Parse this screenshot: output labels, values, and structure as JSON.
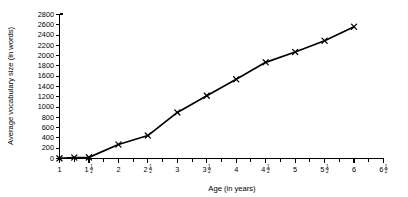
{
  "chart_data": {
    "type": "line",
    "title": "",
    "xlabel": "Age (in years)",
    "ylabel": "Average vocabulary size (in words)",
    "xlim": [
      1,
      6.5
    ],
    "ylim": [
      0,
      2800
    ],
    "grid": false,
    "legend": null,
    "marker": "x",
    "x": [
      1,
      1.25,
      1.5,
      2,
      2.5,
      3,
      3.5,
      4,
      4.5,
      5,
      5.5,
      6
    ],
    "values": [
      3,
      19,
      22,
      272,
      446,
      896,
      1222,
      1540,
      1870,
      2072,
      2289,
      2562
    ],
    "x_tick_labels": [
      "1",
      "1½",
      "2",
      "2½",
      "3",
      "3½",
      "4",
      "4½",
      "5",
      "5½",
      "6",
      "6½"
    ],
    "x_tick_values": [
      1,
      1.5,
      2,
      2.5,
      3,
      3.5,
      4,
      4.5,
      5,
      5.5,
      6,
      6.5
    ],
    "x_tick_fractions": [
      {
        "whole": "1",
        "num": "",
        "den": ""
      },
      {
        "whole": "1",
        "num": "1",
        "den": "2"
      },
      {
        "whole": "2",
        "num": "",
        "den": ""
      },
      {
        "whole": "2",
        "num": "1",
        "den": "2"
      },
      {
        "whole": "3",
        "num": "",
        "den": ""
      },
      {
        "whole": "3",
        "num": "1",
        "den": "2"
      },
      {
        "whole": "4",
        "num": "",
        "den": ""
      },
      {
        "whole": "4",
        "num": "1",
        "den": "2"
      },
      {
        "whole": "5",
        "num": "",
        "den": ""
      },
      {
        "whole": "5",
        "num": "1",
        "den": "2"
      },
      {
        "whole": "6",
        "num": "",
        "den": ""
      },
      {
        "whole": "6",
        "num": "1",
        "den": "2"
      }
    ],
    "x_minor_tick_values": [
      1.25,
      1.75,
      2.25,
      2.75,
      3.25,
      3.75,
      4.25,
      4.75,
      5.25,
      5.75,
      6.25
    ],
    "y_tick_values": [
      0,
      200,
      400,
      600,
      800,
      1000,
      1200,
      1400,
      1600,
      1800,
      2000,
      2200,
      2400,
      2600,
      2800
    ],
    "y_tick_labels": [
      "0",
      "200",
      "400",
      "600",
      "800",
      "1000",
      "1200",
      "1400",
      "1600",
      "1800",
      "2000",
      "2200",
      "2400",
      "2600",
      "2800"
    ],
    "series": [
      {
        "name": "Average vocabulary size",
        "values": [
          3,
          19,
          22,
          272,
          446,
          896,
          1222,
          1540,
          1870,
          2072,
          2289,
          2562
        ]
      }
    ],
    "colors": {
      "line": "#000000",
      "marker": "#000000",
      "axis": "#000000",
      "background": "#ffffff"
    }
  }
}
